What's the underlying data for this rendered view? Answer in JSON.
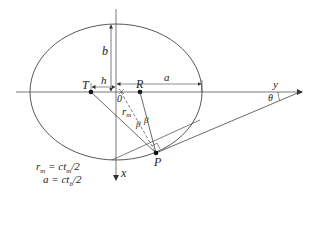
{
  "diagram": {
    "labels": {
      "b": "b",
      "h": "h",
      "a": "a",
      "T": "T",
      "R": "R",
      "origin": "0",
      "rm": "r",
      "rm_sub": "m",
      "beta1": "β",
      "beta2": "β",
      "P": "P",
      "x_axis": "x",
      "y_axis": "y",
      "theta": "θ"
    },
    "equations": {
      "line1_lhs": "r",
      "line1_lhs_sub": "m",
      "line1_rhs": " = ct",
      "line1_rhs_sub": "m",
      "line1_tail": "/2",
      "line2_lhs": "a",
      "line2_rhs": " = ct",
      "line2_rhs_sub": "b",
      "line2_tail": "/2"
    },
    "colors": {
      "stroke": "#444444",
      "text": "#222222",
      "background": "#ffffff"
    }
  }
}
